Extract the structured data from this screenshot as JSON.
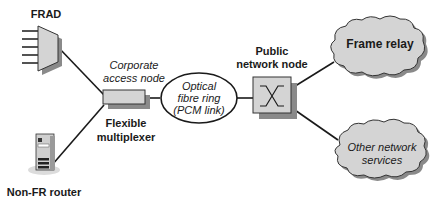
{
  "diagram": {
    "nodes": {
      "frad": {
        "label": "FRAD"
      },
      "non_fr_router": {
        "label": "Non-FR router"
      },
      "corporate_access_node": {
        "caption": "Corporate access node",
        "caption_line1": "Corporate",
        "caption_line2": "access node",
        "label_line1": "Flexible",
        "label_line2": "multiplexer"
      },
      "optical_ring": {
        "line1": "Optical",
        "line2": "fibre ring",
        "line3": "(PCM link)"
      },
      "public_network_node": {
        "line1": "Public",
        "line2": "network node"
      },
      "frame_relay": {
        "label": "Frame relay"
      },
      "other_services": {
        "line1": "Other network",
        "line2": "services"
      }
    },
    "edges": [
      [
        "frad",
        "corporate_access_node"
      ],
      [
        "non_fr_router",
        "corporate_access_node"
      ],
      [
        "corporate_access_node",
        "optical_ring"
      ],
      [
        "optical_ring",
        "public_network_node"
      ],
      [
        "public_network_node",
        "frame_relay"
      ],
      [
        "public_network_node",
        "other_services"
      ]
    ],
    "colors": {
      "fill": "#d4d4d4",
      "shadow": "#8a8a8a",
      "line": "#1a1a1a"
    }
  }
}
